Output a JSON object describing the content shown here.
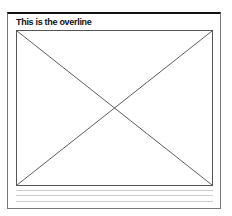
{
  "card": {
    "overline": "This is the overline",
    "image_placeholder": "image-placeholder",
    "text_line_count": 4
  }
}
